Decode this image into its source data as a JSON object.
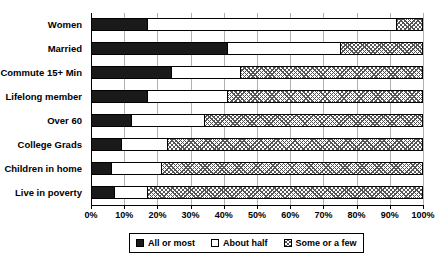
{
  "chart_data": {
    "type": "bar",
    "orientation": "horizontal",
    "stacked": true,
    "title": "",
    "subtitle": "",
    "xlabel": "",
    "ylabel": "",
    "xlim": [
      0,
      100
    ],
    "grid": true,
    "legend_position": "bottom",
    "categories": [
      "Women",
      "Married",
      "Commute 15+ Min",
      "Lifelong member",
      "Over 60",
      "College Grads",
      "Children in home",
      "Live in poverty"
    ],
    "tick_labels": [
      "0%",
      "10%",
      "20%",
      "30%",
      "40%",
      "50%",
      "60%",
      "70%",
      "80%",
      "90%",
      "100%"
    ],
    "tick_values": [
      0,
      10,
      20,
      30,
      40,
      50,
      60,
      70,
      80,
      90,
      100
    ],
    "series": [
      {
        "name": "All or most",
        "color": "#1a1a1a",
        "pattern": "solid",
        "values": [
          17,
          41,
          24,
          17,
          12,
          9,
          6,
          7
        ]
      },
      {
        "name": "About half",
        "color": "#ffffff",
        "pattern": "none",
        "values": [
          75,
          34,
          21,
          24,
          22,
          14,
          15,
          10
        ]
      },
      {
        "name": "Some or a few",
        "color": "#ffffff",
        "pattern": "hatched",
        "values": [
          8,
          25,
          55,
          59,
          66,
          77,
          79,
          83
        ]
      }
    ]
  },
  "legend": {
    "items": [
      {
        "label": "All or most",
        "swatch": "solid-black"
      },
      {
        "label": "About half",
        "swatch": "open-white"
      },
      {
        "label": "Some or a few",
        "swatch": "hatched"
      }
    ]
  }
}
